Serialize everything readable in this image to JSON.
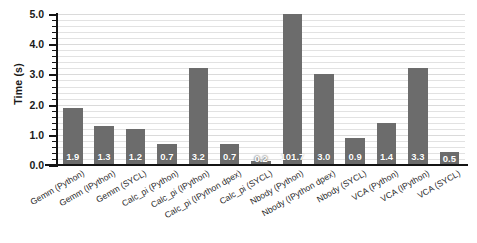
{
  "chart_data": {
    "type": "bar",
    "title": "",
    "xlabel": "",
    "ylabel": "Time (s)",
    "ylim": [
      0.0,
      5.0
    ],
    "ytick_labels": [
      "0.0",
      "1.0",
      "2.0",
      "3.0",
      "4.0",
      "5.0"
    ],
    "ytick_values": [
      0.0,
      1.0,
      2.0,
      3.0,
      4.0,
      5.0
    ],
    "minor_tick_step": 0.2,
    "grid": true,
    "grid_orientation": "horizontal",
    "legend": null,
    "bar_color": "#6c6c6c",
    "value_label_color": "#ffffff",
    "axis_color": "#141414",
    "background_color": "#ffffff",
    "note": "Nbody (Python) bar value 101.7 exceeds the axis maximum and is clipped at 5.0",
    "categories": [
      "Gemm (Python)",
      "Gemm (IPython)",
      "Gemm (SYCL)",
      "Calc_pi (Python)",
      "Calc_pi (IPython)",
      "Calc_pi (IPython dpex)",
      "Calc_pi (SYCL)",
      "Nbody (Python)",
      "Nbody (IPython dpex)",
      "Nbody (SYCL)",
      "VCA (Python)",
      "VCA (IPython)",
      "VCA (SYCL)"
    ],
    "values": [
      1.9,
      1.3,
      1.2,
      0.7,
      3.2,
      0.7,
      0.2,
      101.7,
      3.0,
      0.9,
      1.4,
      3.3,
      0.5
    ],
    "value_labels": [
      "1.9",
      "1.3",
      "1.2",
      "0.7",
      "3.2",
      "0.7",
      "0.2",
      "101.7",
      "3.0",
      "0.9",
      "1.4",
      "3.3",
      "0.5"
    ],
    "plotted_heights": [
      1.9,
      1.3,
      1.2,
      0.7,
      3.2,
      0.7,
      0.13,
      5.0,
      3.0,
      0.9,
      1.4,
      3.2,
      0.43
    ]
  }
}
